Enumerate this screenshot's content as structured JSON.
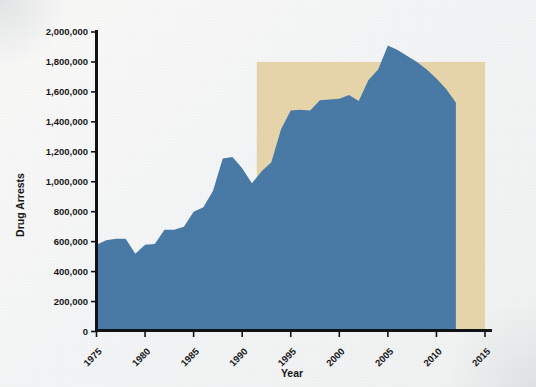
{
  "chart_data": {
    "type": "area",
    "title": "",
    "xlabel": "Year",
    "ylabel": "Drug Arrests",
    "xlim": [
      1975,
      2015
    ],
    "ylim": [
      0,
      2000000
    ],
    "grid": false,
    "legend": "none",
    "x_tick_labels": [
      "1975",
      "1980",
      "1985",
      "1990",
      "1995",
      "2000",
      "2005",
      "2010",
      "2015"
    ],
    "x_tick_values": [
      1975,
      1980,
      1985,
      1990,
      1995,
      2000,
      2005,
      2010,
      2015
    ],
    "y_tick_labels": [
      "0",
      "200,000",
      "400,000",
      "600,000",
      "800,000",
      "1,000,000",
      "1,200,000",
      "1,400,000",
      "1,600,000",
      "1,800,000",
      "2,000,000"
    ],
    "y_tick_values": [
      0,
      200000,
      400000,
      600000,
      800000,
      1000000,
      1200000,
      1400000,
      1600000,
      1800000,
      2000000
    ],
    "series": [
      {
        "name": "Drug Arrests",
        "color": "#4a7ba7",
        "x": [
          1975,
          1976,
          1977,
          1978,
          1979,
          1980,
          1981,
          1982,
          1983,
          1984,
          1985,
          1986,
          1987,
          1988,
          1989,
          1990,
          1991,
          1992,
          1993,
          1994,
          1995,
          1996,
          1997,
          1998,
          1999,
          2000,
          2001,
          2002,
          2003,
          2004,
          2005,
          2006,
          2007,
          2008,
          2009,
          2010,
          2011,
          2012
        ],
        "values": [
          580000,
          610000,
          620000,
          620000,
          520000,
          580000,
          585000,
          680000,
          680000,
          700000,
          800000,
          830000,
          940000,
          1155000,
          1165000,
          1090000,
          990000,
          1070000,
          1130000,
          1350000,
          1475000,
          1480000,
          1475000,
          1545000,
          1550000,
          1555000,
          1580000,
          1540000,
          1680000,
          1750000,
          1910000,
          1880000,
          1840000,
          1800000,
          1750000,
          1690000,
          1620000,
          1530000
        ]
      }
    ],
    "highlight_region": {
      "name": "shaded-reference-block",
      "color": "#e8d6ac",
      "x_start": 1991.5,
      "x_end": 2015,
      "y_bottom": 0,
      "y_top": 1800000
    }
  }
}
